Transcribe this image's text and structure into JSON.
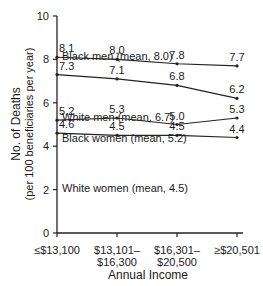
{
  "chart_data": {
    "type": "line",
    "title": "",
    "xlabel": "Annual Income",
    "ylabel": "No. of Deaths",
    "ylabel_sub": "(per 100 beneficiaries per year)",
    "categories": [
      "≤$13,100",
      "$13,101–$16,300",
      "$16,301–$20,500",
      "≥$20,501"
    ],
    "category_lines": [
      [
        "≤$13,100"
      ],
      [
        "$13,101–",
        "$16,300"
      ],
      [
        "$16,301–",
        "$20,500"
      ],
      [
        "≥$20,501"
      ]
    ],
    "ylim": [
      0,
      10
    ],
    "yticks": [
      0,
      2,
      4,
      6,
      8,
      10
    ],
    "grid": false,
    "series": [
      {
        "name": "Black men",
        "label": "Black men (mean, 8.0)",
        "mean": 8.0,
        "values": [
          8.1,
          8.0,
          7.8,
          7.7
        ]
      },
      {
        "name": "White men",
        "label": "White men (mean, 6.7)",
        "mean": 6.7,
        "values": [
          7.3,
          7.1,
          6.8,
          6.2
        ]
      },
      {
        "name": "Black women",
        "label": "Black women (mean, 5.2)",
        "mean": 5.2,
        "values": [
          5.2,
          5.3,
          5.0,
          5.3
        ]
      },
      {
        "name": "White women",
        "label": "White women (mean, 4.5)",
        "mean": 4.5,
        "values": [
          4.6,
          4.5,
          4.5,
          4.4
        ]
      }
    ]
  }
}
